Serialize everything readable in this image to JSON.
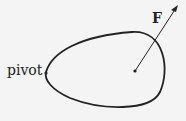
{
  "labels": {
    "pivot": "pivot",
    "force": "F"
  },
  "colors": {
    "stroke": "#222222",
    "background": "#f4f4f4"
  }
}
